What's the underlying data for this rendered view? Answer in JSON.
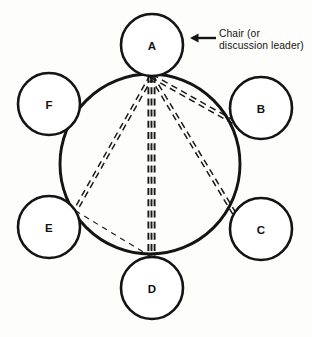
{
  "diagram": {
    "background_color": "#fdfdfc",
    "ink_color": "#141414",
    "table": {
      "name": "discussion-table",
      "cx": 150,
      "cy": 164,
      "r": 90
    },
    "nodes": [
      {
        "id": "A",
        "label": "A",
        "cx": 152,
        "cy": 45,
        "r": 31,
        "role": "chair"
      },
      {
        "id": "B",
        "label": "B",
        "cx": 261,
        "cy": 108,
        "r": 31,
        "role": "member"
      },
      {
        "id": "C",
        "label": "C",
        "cx": 261,
        "cy": 229,
        "r": 31,
        "role": "member"
      },
      {
        "id": "D",
        "label": "D",
        "cx": 152,
        "cy": 288,
        "r": 31,
        "role": "member"
      },
      {
        "id": "E",
        "label": "E",
        "cx": 49,
        "cy": 227,
        "r": 31,
        "role": "member"
      },
      {
        "id": "F",
        "label": "F",
        "cx": 49,
        "cy": 104,
        "r": 31,
        "role": "member"
      }
    ],
    "links": [
      {
        "from": "A",
        "to": "B",
        "strands": 2,
        "weight": "medium",
        "style": "dashed"
      },
      {
        "from": "A",
        "to": "C",
        "strands": 2,
        "weight": "medium",
        "style": "dashed"
      },
      {
        "from": "A",
        "to": "D",
        "strands": 3,
        "weight": "heavy",
        "style": "dashed"
      },
      {
        "from": "A",
        "to": "E",
        "strands": 2,
        "weight": "medium",
        "style": "dashed"
      },
      {
        "from": "E",
        "to": "D",
        "strands": 1,
        "weight": "light",
        "style": "dashed"
      }
    ],
    "annotation": {
      "name": "chair-annotation",
      "target": "A",
      "lines": [
        "Chair (or",
        "discussion leader)"
      ],
      "arrow": {
        "x1": 216,
        "y1": 38,
        "x2": 190,
        "y2": 38,
        "direction": "left"
      }
    }
  }
}
